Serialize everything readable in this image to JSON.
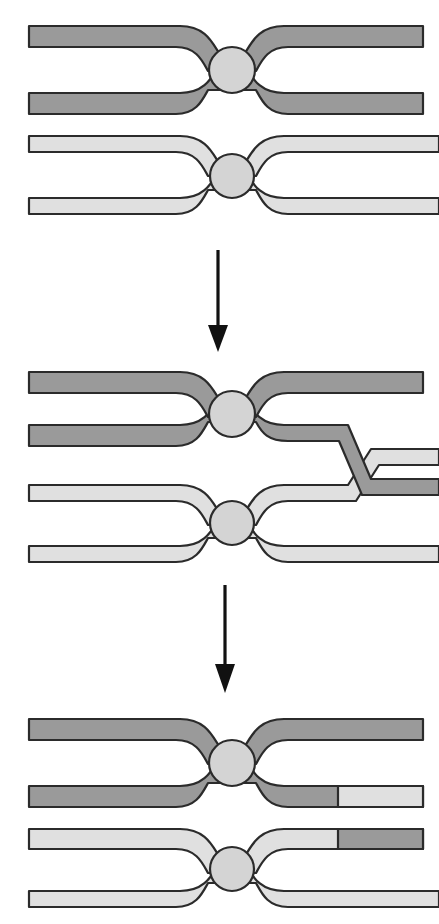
{
  "figure": {
    "title": "Chromosome crossing over and recombination",
    "background_color": "#ffffff",
    "width": 439,
    "height": 924
  },
  "colors": {
    "dark_chromatid_fill": "#9a9a9a",
    "light_chromatid_fill": "#e0e0e0",
    "centromere_fill": "#d4d4d4",
    "outline": "#2b2b2b",
    "arrow": "#111111",
    "background": "#ffffff"
  },
  "legend": {
    "dark_label": "maternal chromosome",
    "light_label": "paternal chromosome",
    "centromere_label": "centromere",
    "crossover_label": "chiasma / crossover point"
  },
  "stages": [
    {
      "id": "stage-pairing",
      "order": 1,
      "name": "Homologous chromosomes paired",
      "description": "Two duplicated homologous chromosomes, each with two sister chromatids joined at a centromere. No exchange has occurred.",
      "chromosomes": [
        {
          "id": "chromosome-dark-1",
          "shade": "dark",
          "label": "maternal chromosome",
          "chromatids": [
            {
              "id": "dark-1-chromatid-upper",
              "left_segment": "dark",
              "right_segment": "dark"
            },
            {
              "id": "dark-1-chromatid-lower",
              "left_segment": "dark",
              "right_segment": "dark"
            }
          ]
        },
        {
          "id": "chromosome-light-1",
          "shade": "light",
          "label": "paternal chromosome",
          "chromatids": [
            {
              "id": "light-1-chromatid-upper",
              "left_segment": "light",
              "right_segment": "light"
            },
            {
              "id": "light-1-chromatid-lower",
              "left_segment": "light",
              "right_segment": "light"
            }
          ]
        }
      ]
    },
    {
      "id": "stage-crossover",
      "order": 2,
      "name": "Crossing over at the chiasma",
      "description": "The inner chromatids of the two homologues cross and exchange arms at a chiasma on the right arm.",
      "crossover": {
        "present": true,
        "position": "right arm",
        "participating_chromatids": [
          "dark-2-chromatid-lower",
          "light-2-chromatid-upper"
        ]
      },
      "chromosomes": [
        {
          "id": "chromosome-dark-2",
          "shade": "dark",
          "label": "maternal chromosome",
          "chromatids": [
            {
              "id": "dark-2-chromatid-upper",
              "left_segment": "dark",
              "right_segment": "dark"
            },
            {
              "id": "dark-2-chromatid-lower",
              "left_segment": "dark",
              "right_segment": "dark",
              "crosses": true
            }
          ]
        },
        {
          "id": "chromosome-light-2",
          "shade": "light",
          "label": "paternal chromosome",
          "chromatids": [
            {
              "id": "light-2-chromatid-upper",
              "left_segment": "light",
              "right_segment": "light",
              "crosses": true
            },
            {
              "id": "light-2-chromatid-lower",
              "left_segment": "light",
              "right_segment": "light"
            }
          ]
        }
      ]
    },
    {
      "id": "stage-recombinant",
      "order": 3,
      "name": "Recombinant chromatids after exchange",
      "description": "The chromosomes separate. One chromatid of each chromosome now carries a terminal segment from the homologue, producing recombinant chromatids.",
      "chromosomes": [
        {
          "id": "chromosome-dark-3",
          "shade": "dark",
          "label": "recombinant maternal chromosome",
          "chromatids": [
            {
              "id": "dark-3-chromatid-upper",
              "left_segment": "dark",
              "right_segment": "dark",
              "recombinant": false
            },
            {
              "id": "dark-3-chromatid-lower",
              "left_segment": "dark",
              "right_segment": "light",
              "recombinant": true,
              "swapped_tip": "light"
            }
          ]
        },
        {
          "id": "chromosome-light-3",
          "shade": "light",
          "label": "recombinant paternal chromosome",
          "chromatids": [
            {
              "id": "light-3-chromatid-upper",
              "left_segment": "light",
              "right_segment": "dark",
              "recombinant": true,
              "swapped_tip": "dark"
            },
            {
              "id": "light-3-chromatid-lower",
              "left_segment": "light",
              "right_segment": "light",
              "recombinant": false
            }
          ]
        }
      ]
    }
  ],
  "arrows": [
    {
      "id": "arrow-1",
      "from_stage": "stage-pairing",
      "to_stage": "stage-crossover",
      "direction": "down"
    },
    {
      "id": "arrow-2",
      "from_stage": "stage-crossover",
      "to_stage": "stage-recombinant",
      "direction": "down"
    }
  ]
}
